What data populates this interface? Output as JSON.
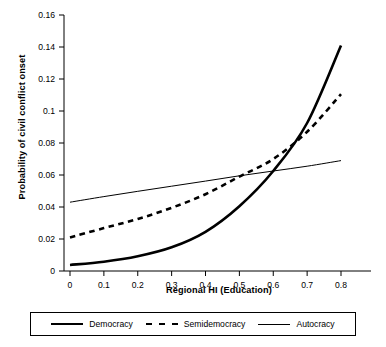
{
  "chart_data": {
    "type": "line",
    "title": "",
    "xlabel": "Regional HI (Education)",
    "ylabel": "Probability of civil conflict onset",
    "xlim": [
      0,
      0.85
    ],
    "ylim": [
      0,
      0.16
    ],
    "xticks": [
      "0",
      "0.1",
      "0.2",
      "0.3",
      "0.4",
      "0.5",
      "0.6",
      "0.7",
      "0.8"
    ],
    "xtick_values": [
      0,
      0.1,
      0.2,
      0.3,
      0.4,
      0.5,
      0.6,
      0.7,
      0.8
    ],
    "yticks": [
      "0",
      "0.02",
      "0.04",
      "0.06",
      "0.08",
      "0.1",
      "0.12",
      "0.14",
      "0.16"
    ],
    "ytick_values": [
      0,
      0.02,
      0.04,
      0.06,
      0.08,
      0.1,
      0.12,
      0.14,
      0.16
    ],
    "grid": false,
    "legend_position": "bottom",
    "x": [
      0,
      0.1,
      0.2,
      0.3,
      0.4,
      0.5,
      0.6,
      0.7,
      0.8
    ],
    "series": [
      {
        "name": "Democracy",
        "style": "solid-thick",
        "color": "#000000",
        "values": [
          0.0038,
          0.0058,
          0.0092,
          0.0148,
          0.0245,
          0.0405,
          0.0625,
          0.0925,
          0.141
        ]
      },
      {
        "name": "Semidemocracy",
        "style": "dashed",
        "color": "#000000",
        "values": [
          0.021,
          0.0268,
          0.0325,
          0.0395,
          0.048,
          0.059,
          0.07,
          0.087,
          0.1105
        ]
      },
      {
        "name": "Autocracy",
        "style": "solid-thin",
        "color": "#000000",
        "values": [
          0.043,
          0.0465,
          0.0498,
          0.053,
          0.0562,
          0.0595,
          0.0625,
          0.0655,
          0.069
        ]
      }
    ],
    "annotations": []
  },
  "legend": {
    "items": [
      {
        "label": "Democracy",
        "swatch": "thick-solid-line-icon"
      },
      {
        "label": "Semidemocracy",
        "swatch": "dashed-line-icon"
      },
      {
        "label": "Autocracy",
        "swatch": "thin-solid-line-icon"
      }
    ]
  }
}
